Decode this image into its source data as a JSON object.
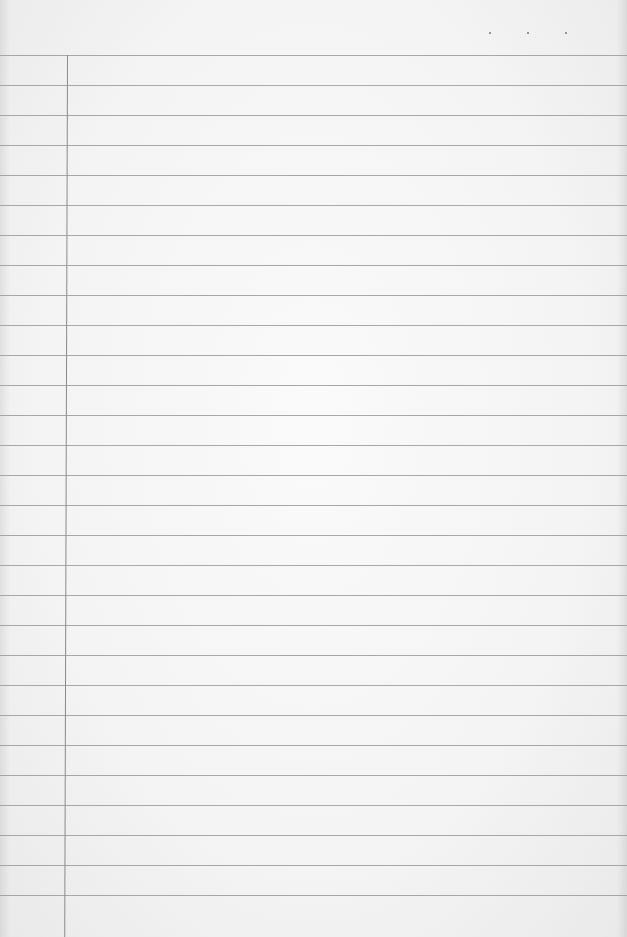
{
  "page": {
    "type": "lined-notebook-paper",
    "background_color": "#f4f4f4",
    "rule_color": "#9a9a9a",
    "margin_line_color": "#8a8a8a"
  },
  "rules": {
    "first_y": 55,
    "spacing": 30,
    "count": 29
  },
  "margin": {
    "x": 67
  },
  "dots": [
    {
      "x": 489,
      "y": 32
    },
    {
      "x": 527,
      "y": 32
    },
    {
      "x": 565,
      "y": 32
    }
  ]
}
